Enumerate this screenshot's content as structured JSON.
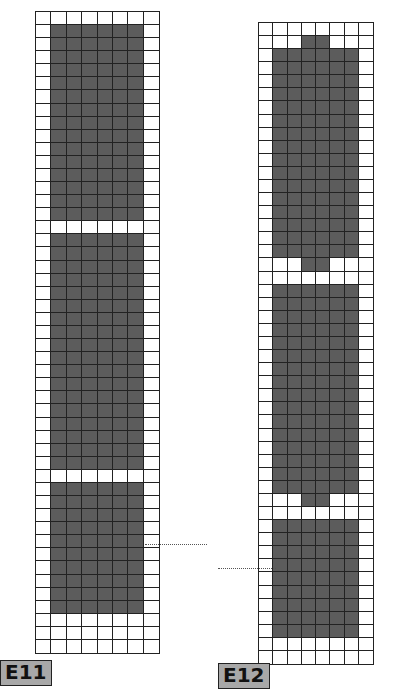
{
  "diagrams": [
    {
      "label": "E11",
      "cols": 8,
      "rows": 49,
      "fill_color": "#5c5c5c",
      "filled_row_ranges": [
        [
          1,
          15
        ],
        [
          17,
          34
        ],
        [
          36,
          45
        ]
      ],
      "partial_rows": [],
      "fill_cols": [
        1,
        6
      ]
    },
    {
      "label": "E12",
      "cols": 8,
      "rows": 49,
      "fill_color": "#5c5c5c",
      "filled_row_ranges": [
        [
          2,
          17
        ],
        [
          20,
          35
        ],
        [
          38,
          46
        ]
      ],
      "partial_rows": [
        [
          1,
          [
            3,
            4
          ]
        ],
        [
          18,
          [
            3,
            4
          ]
        ],
        [
          36,
          [
            3,
            4
          ]
        ]
      ],
      "fill_cols": [
        1,
        6
      ]
    }
  ]
}
